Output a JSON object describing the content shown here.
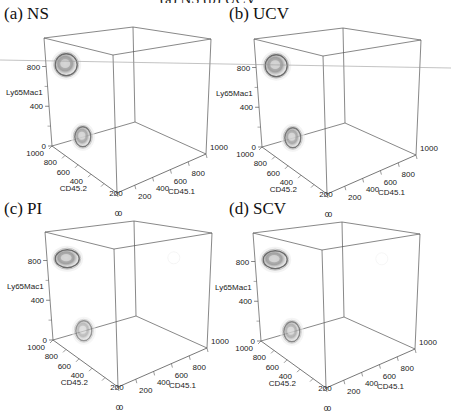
{
  "figure": {
    "top_cut_text": "(a) NS          (b) UCV",
    "scan_line": {
      "x1": 0,
      "y1": 60,
      "x2": 451,
      "y2": 68,
      "color": "#9a9a9a"
    }
  },
  "chart_data": [
    {
      "type": "3d-density",
      "title": "(a) NS",
      "xlabel": "CD45.1",
      "ylabel": "CD45.2",
      "zlabel": "Ly65Mac1",
      "x_ticks": [
        0,
        200,
        400,
        600,
        800,
        1000
      ],
      "y_ticks": [
        0,
        200,
        400,
        600,
        800,
        1000
      ],
      "z_ticks": [
        0,
        400,
        800
      ],
      "xlim": [
        0,
        1000
      ],
      "ylim": [
        0,
        1000
      ],
      "zlim": [
        0,
        1000
      ],
      "clusters": [
        {
          "label": "upper",
          "CD45.1": 50,
          "CD45.2": 850,
          "Ly65Mac1": 800,
          "size": "large",
          "intensity": 0.7
        },
        {
          "label": "lower",
          "CD45.1": 200,
          "CD45.2": 800,
          "Ly65Mac1": 100,
          "size": "medium",
          "intensity": 0.6
        }
      ]
    },
    {
      "type": "3d-density",
      "title": "(b) UCV",
      "xlabel": "CD45.1",
      "ylabel": "CD45.2",
      "zlabel": "Ly65Mac1",
      "x_ticks": [
        0,
        200,
        400,
        600,
        800,
        1000
      ],
      "y_ticks": [
        0,
        200,
        400,
        600,
        800,
        1000
      ],
      "z_ticks": [
        0,
        400,
        800
      ],
      "xlim": [
        0,
        1000
      ],
      "ylim": [
        0,
        1000
      ],
      "zlim": [
        0,
        1000
      ],
      "clusters": [
        {
          "label": "upper",
          "CD45.1": 50,
          "CD45.2": 850,
          "Ly65Mac1": 800,
          "size": "large",
          "intensity": 0.7
        },
        {
          "label": "lower",
          "CD45.1": 200,
          "CD45.2": 800,
          "Ly65Mac1": 100,
          "size": "medium",
          "intensity": 0.6
        }
      ]
    },
    {
      "type": "3d-density",
      "title": "(c) PI",
      "xlabel": "CD45.1",
      "ylabel": "CD45.2",
      "zlabel": "Ly65Mac1",
      "x_ticks": [
        0,
        200,
        400,
        600,
        800,
        1000
      ],
      "y_ticks": [
        0,
        200,
        400,
        600,
        800,
        1000
      ],
      "z_ticks": [
        0,
        400,
        800
      ],
      "xlim": [
        0,
        1000
      ],
      "ylim": [
        0,
        1000
      ],
      "zlim": [
        0,
        1000
      ],
      "clusters": [
        {
          "label": "upper",
          "CD45.1": 50,
          "CD45.2": 850,
          "Ly65Mac1": 800,
          "size": "large-flat",
          "intensity": 0.8
        },
        {
          "label": "lower",
          "CD45.1": 200,
          "CD45.2": 800,
          "Ly65Mac1": 100,
          "size": "medium",
          "intensity": 0.4
        },
        {
          "label": "faint",
          "CD45.1": 700,
          "CD45.2": 100,
          "Ly65Mac1": 900,
          "size": "small",
          "intensity": 0.08
        }
      ]
    },
    {
      "type": "3d-density",
      "title": "(d) SCV",
      "xlabel": "CD45.1",
      "ylabel": "CD45.2",
      "zlabel": "Ly65Mac1",
      "x_ticks": [
        0,
        200,
        400,
        600,
        800,
        1000
      ],
      "y_ticks": [
        0,
        200,
        400,
        600,
        800,
        1000
      ],
      "z_ticks": [
        0,
        400,
        800
      ],
      "xlim": [
        0,
        1000
      ],
      "ylim": [
        0,
        1000
      ],
      "zlim": [
        0,
        1000
      ],
      "clusters": [
        {
          "label": "upper",
          "CD45.1": 50,
          "CD45.2": 850,
          "Ly65Mac1": 800,
          "size": "large-flat",
          "intensity": 0.8
        },
        {
          "label": "lower",
          "CD45.1": 200,
          "CD45.2": 800,
          "Ly65Mac1": 100,
          "size": "medium",
          "intensity": 0.5
        },
        {
          "label": "faint",
          "CD45.1": 700,
          "CD45.2": 100,
          "Ly65Mac1": 900,
          "size": "small",
          "intensity": 0.06
        }
      ]
    }
  ],
  "panels": [
    {
      "id": "a",
      "title": "(a) NS",
      "dx": 0,
      "dy": 0,
      "title_x": 4,
      "title_y": 14
    },
    {
      "id": "b",
      "title": "(b) UCV",
      "dx": 210,
      "dy": 1,
      "title_x": 229,
      "title_y": 14
    },
    {
      "id": "c",
      "title": "(c) PI",
      "dx": 1,
      "dy": 194,
      "title_x": 19,
      "title_y": 208
    },
    {
      "id": "d",
      "title": "(d) SCV",
      "dx": 209,
      "dy": 195,
      "title_x": 229,
      "title_y": 208
    }
  ],
  "geometry": {
    "top_left": [
      44,
      38
    ],
    "top_back": [
      133,
      27
    ],
    "top_right": [
      211,
      39
    ],
    "top_front": [
      113,
      55
    ],
    "bot_left": [
      52,
      146
    ],
    "bot_back": [
      135,
      122
    ],
    "bot_right": [
      206,
      154
    ],
    "bot_front": [
      117,
      193
    ]
  },
  "colors": {
    "axis": "#555555",
    "tick_text": "#222222",
    "blob_dark": "#6b6b6b",
    "blob_mid": "#a0a0a0",
    "blob_light": "#d8d8d8"
  }
}
